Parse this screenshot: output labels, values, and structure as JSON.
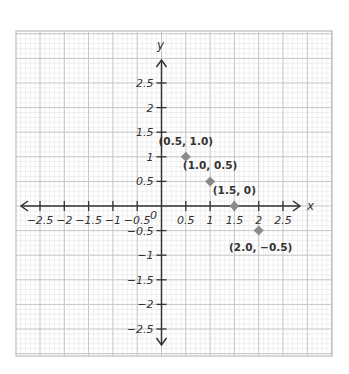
{
  "chart_data": {
    "type": "scatter",
    "title": "",
    "xlabel": "x",
    "ylabel": "y",
    "xlim": [
      -2.5,
      2.5
    ],
    "ylim": [
      -2.5,
      2.5
    ],
    "grid": true,
    "legend": null,
    "origin_label": "0",
    "x_ticks": [
      -2.5,
      -2,
      -1.5,
      -1,
      -0.5,
      0.5,
      1,
      1.5,
      2,
      2.5
    ],
    "x_tick_labels": [
      "-2.5",
      "-2",
      "-1.5",
      "-1",
      "-0.5",
      "0.5",
      "1",
      "1.5",
      "2",
      "2.5"
    ],
    "y_ticks": [
      2.5,
      2,
      1.5,
      1,
      0.5,
      -0.5,
      -1,
      -1.5,
      -2,
      -2.5
    ],
    "y_tick_labels": [
      "2.5",
      "2",
      "1.5",
      "1",
      "0.5",
      "-0.5",
      "-1",
      "-1.5",
      "-2",
      "-2.5"
    ],
    "series": [
      {
        "name": "points",
        "marker": "diamond",
        "color": "#8a8a8a",
        "points": [
          {
            "x": 0.5,
            "y": 1.0,
            "label": "(0.5, 1.0)"
          },
          {
            "x": 1.0,
            "y": 0.5,
            "label": "(1.0, 0.5)"
          },
          {
            "x": 1.5,
            "y": 0.0,
            "label": "(1.5, 0)"
          },
          {
            "x": 2.0,
            "y": -0.5,
            "label": "(2.0, -0.5)"
          }
        ]
      }
    ]
  },
  "style": {
    "axis_color": "#333333",
    "major_grid_color": "#c4c4c4",
    "minor_grid_color": "#e6e6e6",
    "frame_color": "#bdbdbd",
    "marker_color": "#8a8a8a"
  }
}
